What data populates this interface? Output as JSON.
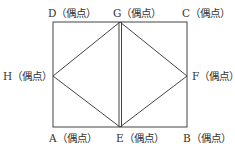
{
  "diagram": {
    "title": "",
    "vertices": {
      "A": {
        "label": "A（偶点）",
        "x": 53,
        "y": 127
      },
      "B": {
        "label": "B（偶点）",
        "x": 187,
        "y": 127
      },
      "C": {
        "label": "C（偶点）",
        "x": 187,
        "y": 22
      },
      "D": {
        "label": "D（偶点）",
        "x": 53,
        "y": 22
      },
      "E": {
        "label": "E（偶点）",
        "x": 120,
        "y": 127
      },
      "F": {
        "label": "F（偶点）",
        "x": 187,
        "y": 76
      },
      "G": {
        "label": "G（偶点）",
        "x": 120,
        "y": 22
      },
      "H": {
        "label": "H（偶点）",
        "x": 53,
        "y": 76
      }
    },
    "edges": [
      [
        "D",
        "G"
      ],
      [
        "G",
        "C"
      ],
      [
        "C",
        "F"
      ],
      [
        "F",
        "B"
      ],
      [
        "B",
        "E"
      ],
      [
        "E",
        "A"
      ],
      [
        "A",
        "H"
      ],
      [
        "H",
        "D"
      ],
      [
        "G",
        "H"
      ],
      [
        "H",
        "E"
      ],
      [
        "G",
        "F"
      ],
      [
        "F",
        "E"
      ],
      [
        "G",
        "E"
      ],
      [
        "G",
        "E"
      ]
    ],
    "line_color": "#444444"
  }
}
